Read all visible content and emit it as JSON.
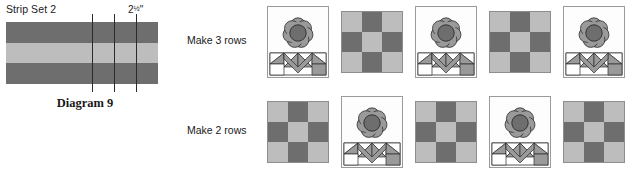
{
  "figure": {
    "caption": "Diagram 9"
  },
  "strip_set": {
    "title": "Strip Set 2",
    "measurement": "2",
    "measurement_fraction": "1/2",
    "measurement_unit": "\"",
    "bands": [
      {
        "name": "top-strip",
        "color": "#6e6e6e"
      },
      {
        "name": "middle-strip",
        "color": "#bdbdbd"
      },
      {
        "name": "bottom-strip",
        "color": "#6e6e6e"
      }
    ],
    "cut_lines": 3
  },
  "assembly": {
    "rows": [
      {
        "label": "Make 3 rows",
        "blocks": [
          "flower",
          "checker",
          "flower",
          "checker",
          "flower"
        ]
      },
      {
        "label": "Make 2 rows",
        "blocks": [
          "checker",
          "flower",
          "checker",
          "flower",
          "checker"
        ]
      }
    ]
  },
  "palette": {
    "dark_gray": "#6e6e6e",
    "light_gray": "#bdbdbd",
    "flower_petal": "#9a9a9a",
    "flower_center": "#6e6e6e",
    "background": "#ffffff",
    "outline": "#2b2b2b"
  },
  "checker_pattern": [
    [
      "light",
      "dark",
      "light"
    ],
    [
      "dark",
      "light",
      "dark"
    ],
    [
      "light",
      "dark",
      "light"
    ]
  ]
}
